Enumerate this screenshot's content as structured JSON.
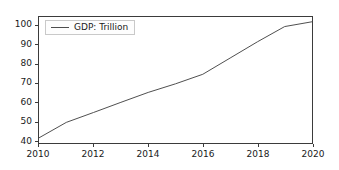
{
  "chart_data": {
    "type": "line",
    "title": "",
    "xlabel": "",
    "ylabel": "",
    "xlim": [
      2010,
      2020
    ],
    "ylim": [
      38.5,
      104.5
    ],
    "grid": false,
    "legend_position": "upper left",
    "x": [
      2010,
      2011,
      2012,
      2013,
      2014,
      2015,
      2016,
      2017,
      2018,
      2019,
      2020
    ],
    "xticks": [
      "2010",
      "2012",
      "2014",
      "2016",
      "2018",
      "2020"
    ],
    "xtick_values": [
      2010,
      2012,
      2014,
      2016,
      2018,
      2020
    ],
    "yticks": [
      "40",
      "50",
      "60",
      "70",
      "80",
      "90",
      "100"
    ],
    "ytick_values": [
      40,
      50,
      60,
      70,
      80,
      90,
      100
    ],
    "series": [
      {
        "name": "GDP: Trillion",
        "color": "#4d4d4d",
        "values": [
          41.2,
          49.3,
          54.5,
          59.8,
          65.0,
          69.5,
          74.5,
          83.0,
          91.5,
          99.5,
          102.0
        ]
      }
    ]
  },
  "legend": {
    "entries": [
      {
        "label": "GDP: Trillion"
      }
    ]
  }
}
